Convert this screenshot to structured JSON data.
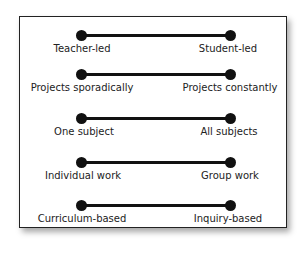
{
  "figure": {
    "continua": [
      {
        "left": "Teacher-led",
        "right": "Student-led"
      },
      {
        "left": "Projects sporadically",
        "right": "Projects constantly"
      },
      {
        "left": "One subject",
        "right": "All subjects"
      },
      {
        "left": "Individual work",
        "right": "Group work"
      },
      {
        "left": "Curriculum-based",
        "right": "Inquiry-based"
      }
    ]
  }
}
